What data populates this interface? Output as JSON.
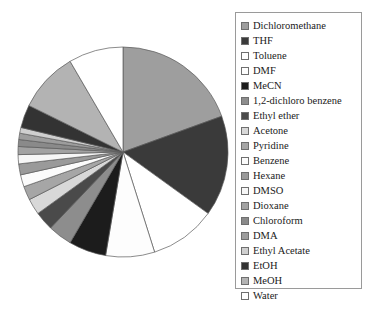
{
  "chart_data": {
    "type": "pie",
    "title": "",
    "legend_position": "right",
    "start_angle_deg": 90,
    "direction": "clockwise",
    "categories": [
      "Dichloromethane",
      "THF",
      "Toluene",
      "DMF",
      "MeCN",
      "1,2-dichloro benzene",
      "Ethyl ether",
      "Acetone",
      "Pyridine",
      "Benzene",
      "Hexane",
      "DMSO",
      "Dioxane",
      "Chloroform",
      "DMA",
      "Ethyl Acetate",
      "EtOH",
      "MeOH",
      "Water"
    ],
    "values": [
      22.0,
      17.5,
      11.5,
      8.5,
      6.5,
      4.2,
      3.3,
      2.8,
      2.4,
      2.1,
      1.9,
      1.6,
      1.4,
      1.2,
      1.1,
      1.0,
      4.0,
      10.5,
      9.5
    ],
    "colors": [
      "#9e9e9e",
      "#3a3a3a",
      "#ffffff",
      "#fdfdfd",
      "#1c1c1c",
      "#8d8d8d",
      "#4a4a4a",
      "#d8d8d8",
      "#a6a6a6",
      "#fbfbfb",
      "#9a9a9a",
      "#f6f6f6",
      "#a2a2a2",
      "#8a8a8a",
      "#9d9d9d",
      "#cfcfcf",
      "#333333",
      "#b3b3b3",
      "#ffffff"
    ],
    "slice_border_color": "#5a5a5a",
    "legend_border_color": "#9a9a9a"
  },
  "legend": {
    "items": [
      {
        "label": "Dichloromethane",
        "color": "#9e9e9e"
      },
      {
        "label": "THF",
        "color": "#3a3a3a"
      },
      {
        "label": "Toluene",
        "color": "#ffffff"
      },
      {
        "label": "DMF",
        "color": "#fdfdfd"
      },
      {
        "label": "MeCN",
        "color": "#1c1c1c"
      },
      {
        "label": "1,2-dichloro benzene",
        "color": "#8d8d8d"
      },
      {
        "label": "Ethyl ether",
        "color": "#4a4a4a"
      },
      {
        "label": "Acetone",
        "color": "#d8d8d8"
      },
      {
        "label": "Pyridine",
        "color": "#a6a6a6"
      },
      {
        "label": "Benzene",
        "color": "#fbfbfb"
      },
      {
        "label": "Hexane",
        "color": "#9a9a9a"
      },
      {
        "label": "DMSO",
        "color": "#f6f6f6"
      },
      {
        "label": "Dioxane",
        "color": "#a2a2a2"
      },
      {
        "label": "Chloroform",
        "color": "#8a8a8a"
      },
      {
        "label": "DMA",
        "color": "#9d9d9d"
      },
      {
        "label": "Ethyl Acetate",
        "color": "#cfcfcf"
      },
      {
        "label": "EtOH",
        "color": "#333333"
      },
      {
        "label": "MeOH",
        "color": "#b3b3b3"
      },
      {
        "label": "Water",
        "color": "#ffffff"
      }
    ]
  }
}
